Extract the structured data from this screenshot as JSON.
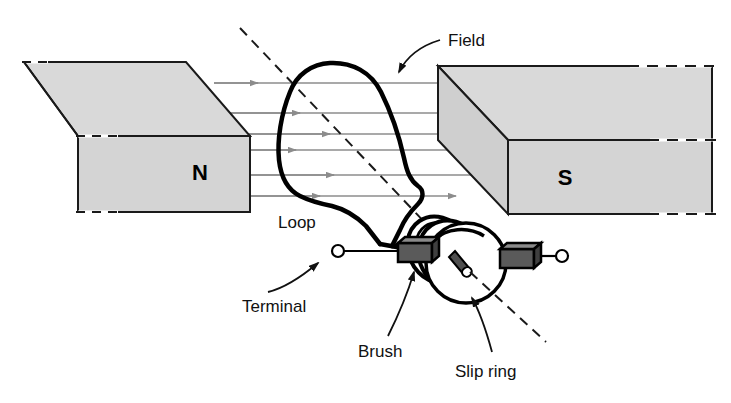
{
  "figure": {
    "background_color": "#ffffff"
  },
  "colors": {
    "magnet_fill": "#d9d9d9",
    "magnet_fill_dark": "#cfcfcf",
    "magnet_edge": "#1a1a1a",
    "field_line": "#8c8c8c",
    "loop_wire": "#000000",
    "brush_fill": "#5a5a5a",
    "label_text": "#111111",
    "axis_dash": "#1a1a1a"
  },
  "labels": {
    "field": "Field",
    "loop": "Loop",
    "terminal": "Terminal",
    "brush": "Brush",
    "slip_ring": "Slip ring"
  },
  "poles": {
    "north": "N",
    "south": "S"
  },
  "field": {
    "direction": "left-to-right",
    "line_count": 6,
    "line_y": [
      83,
      113,
      134,
      150,
      175,
      196
    ],
    "arrowheads_per_line": [
      2,
      2,
      2,
      2,
      2,
      2
    ]
  },
  "components": {
    "left_magnet": "N-pole magnet block",
    "right_magnet": "S-pole magnet block",
    "loop": "rotating wire loop",
    "slip_rings": 2,
    "brushes": 2,
    "terminals": 2,
    "rotation_axis": "dashed diagonal line"
  }
}
